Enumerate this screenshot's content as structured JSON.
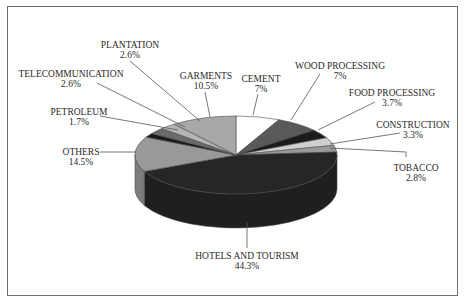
{
  "chart_data": {
    "type": "pie",
    "style": "3d",
    "title": "",
    "legend": "none",
    "slices": [
      {
        "label": "CEMENT",
        "value": 7.0,
        "display": "7%",
        "color": "#ffffff"
      },
      {
        "label": "WOOD PROCESSING",
        "value": 7.0,
        "display": "7%",
        "color": "#595959"
      },
      {
        "label": "FOOD PROCESSING",
        "value": 3.7,
        "display": "3.7%",
        "color": "#1c1c1c"
      },
      {
        "label": "CONSTRUCTION",
        "value": 3.3,
        "display": "3.3%",
        "color": "#cfcfcf"
      },
      {
        "label": "TOBACCO",
        "value": 2.8,
        "display": "2.8%",
        "color": "#9a9a9a"
      },
      {
        "label": "HOTELS AND TOURISM",
        "value": 44.3,
        "display": "44.3%",
        "color": "#262626"
      },
      {
        "label": "OTHERS",
        "value": 14.5,
        "display": "14.5%",
        "color": "#999999"
      },
      {
        "label": "PETROLEUM",
        "value": 1.7,
        "display": "1.7%",
        "color": "#1a1a1a"
      },
      {
        "label": "TELECOMMUNICATION",
        "value": 2.6,
        "display": "2.6%",
        "color": "#6a6a6a"
      },
      {
        "label": "PLANTATION",
        "value": 2.6,
        "display": "2.6%",
        "color": "#b5b5b5"
      },
      {
        "label": "GARMENTS",
        "value": 10.5,
        "display": "10.5%",
        "color": "#a8a8a8"
      }
    ],
    "categories": [
      "CEMENT",
      "WOOD PROCESSING",
      "FOOD PROCESSING",
      "CONSTRUCTION",
      "TOBACCO",
      "HOTELS AND TOURISM",
      "OTHERS",
      "PETROLEUM",
      "TELECOMMUNICATION",
      "PLANTATION",
      "GARMENTS"
    ],
    "values": [
      7.0,
      7.0,
      3.7,
      3.3,
      2.8,
      44.3,
      14.5,
      1.7,
      2.6,
      2.6,
      10.5
    ],
    "unit": "%"
  },
  "labels": {
    "plantation": {
      "name": "PLANTATION",
      "pct": "2.6%"
    },
    "telecommunication": {
      "name": "TELECOMMUNICATION",
      "pct": "2.6%"
    },
    "petroleum": {
      "name": "PETROLEUM",
      "pct": "1.7%"
    },
    "others": {
      "name": "OTHERS",
      "pct": "14.5%"
    },
    "garments": {
      "name": "GARMENTS",
      "pct": "10.5%"
    },
    "cement": {
      "name": "CEMENT",
      "pct": "7%"
    },
    "wood": {
      "name": "WOOD PROCESSING",
      "pct": "7%"
    },
    "food": {
      "name": "FOOD PROCESSING",
      "pct": "3.7%"
    },
    "construction": {
      "name": "CONSTRUCTION",
      "pct": "3.3%"
    },
    "tobacco": {
      "name": "TOBACCO",
      "pct": "2.8%"
    },
    "hotels": {
      "name": "HOTELS AND TOURISM",
      "pct": "44.3%"
    }
  }
}
